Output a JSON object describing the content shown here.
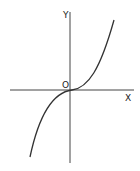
{
  "diagram": {
    "type": "function-graph",
    "function": "y = x^3",
    "labels": {
      "y_axis": "Y",
      "x_axis": "X",
      "origin": "O"
    },
    "colors": {
      "line": "#333333",
      "background": "#ffffff"
    }
  }
}
